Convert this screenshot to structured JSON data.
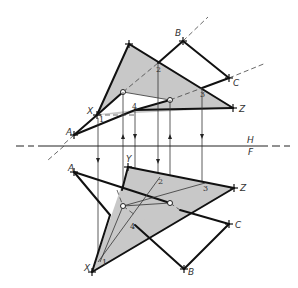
{
  "figure": {
    "type": "descriptive-geometry",
    "fold_line": {
      "upper_label": "H",
      "lower_label": "F"
    },
    "top_view": {
      "labels": {
        "A": "A",
        "B": "B",
        "C": "C",
        "X": "X",
        "Y": "Y",
        "Z": "Z"
      },
      "numbers": {
        "n1": "1",
        "n2": "2",
        "n3": "3",
        "n4": "4"
      }
    },
    "front_view": {
      "labels": {
        "A": "A",
        "B": "B",
        "C": "C",
        "X": "X",
        "Y": "Y",
        "Z": "Z"
      },
      "numbers": {
        "n1": "1",
        "n2": "2",
        "n3": "3",
        "n4": "4"
      }
    },
    "colors": {
      "plane_fill": "#c8c8c8",
      "line": "#111111",
      "background": "#ffffff"
    }
  }
}
